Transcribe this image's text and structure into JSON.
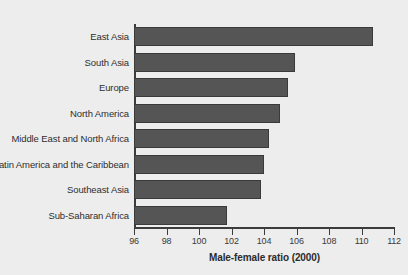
{
  "chart_data": {
    "type": "bar",
    "orientation": "horizontal",
    "title": "",
    "subtitle": "",
    "xlabel": "Male-female ratio (2000)",
    "ylabel": "",
    "xlim": [
      96,
      112
    ],
    "xticks": [
      96,
      98,
      100,
      102,
      104,
      106,
      108,
      110,
      112
    ],
    "xtick_labels": [
      "96",
      "98",
      "100",
      "102",
      "104",
      "106",
      "108",
      "110",
      "112"
    ],
    "grid": false,
    "legend": null,
    "categories": [
      "East Asia",
      "South Asia",
      "Europe",
      "North America",
      "Middle East and North Africa",
      "Latin America and the Caribbean",
      "Southeast Asia",
      "Sub-Saharan Africa"
    ],
    "values": [
      110.7,
      105.9,
      105.5,
      105.0,
      104.3,
      104.0,
      103.8,
      101.7
    ],
    "bar_color": "#555555",
    "bar_edge_color": "#3a3a3a",
    "background_color": "#ededed",
    "axis_color": "#3c3c3c",
    "text_color": "#2e2e2e"
  }
}
